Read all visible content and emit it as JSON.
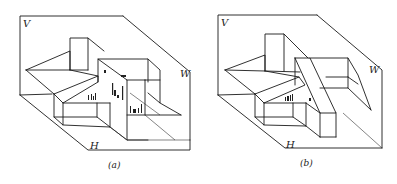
{
  "figure_a": {
    "caption": "(a)",
    "plane_labels": {
      "vertical": "V",
      "side": "W",
      "horizontal": "H"
    },
    "notes": [
      "a'",
      "b'",
      "a\"",
      "b\"",
      "a b"
    ]
  },
  "figure_b": {
    "caption": "(b)",
    "plane_labels": {
      "vertical": "V",
      "side": "W",
      "horizontal": "H"
    },
    "notes": [
      "a b",
      "a"
    ]
  },
  "colors": {
    "line": "#1a1a1a",
    "background": "#ffffff"
  }
}
